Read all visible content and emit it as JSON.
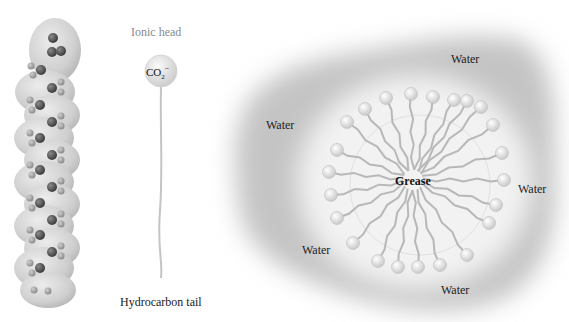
{
  "figure": {
    "molecule_model": {
      "description": "space-filling model of a soap (carboxylate) molecule"
    },
    "schematic": {
      "head_label": "Ionic head",
      "head_formula": {
        "base": "CO",
        "subscript": "2",
        "superscript": "−"
      },
      "tail_label": "Hydrocarbon tail"
    },
    "micelle": {
      "center_label": "Grease",
      "water_labels": [
        {
          "text": "Water",
          "x": 451,
          "y": 63
        },
        {
          "text": "Water",
          "x": 266,
          "y": 130
        },
        {
          "text": "Water",
          "x": 518,
          "y": 193
        },
        {
          "text": "Water",
          "x": 302,
          "y": 255
        },
        {
          "text": "Water",
          "x": 441,
          "y": 294
        }
      ],
      "center": {
        "x": 413,
        "y": 180
      },
      "head_count": 23,
      "heads": [
        [
          386,
          98
        ],
        [
          411,
          94
        ],
        [
          433,
          97
        ],
        [
          454,
          100
        ],
        [
          467,
          101
        ],
        [
          481,
          107
        ],
        [
          347,
          122
        ],
        [
          365,
          109
        ],
        [
          493,
          125
        ],
        [
          337,
          150
        ],
        [
          502,
          153
        ],
        [
          329,
          172
        ],
        [
          504,
          180
        ],
        [
          331,
          195
        ],
        [
          496,
          205
        ],
        [
          337,
          218
        ],
        [
          489,
          223
        ],
        [
          353,
          243
        ],
        [
          467,
          255
        ],
        [
          378,
          261
        ],
        [
          398,
          267
        ],
        [
          418,
          267
        ],
        [
          440,
          265
        ]
      ]
    },
    "colors": {
      "background": "#ffffff",
      "water_halo": "#c9c9c9",
      "micelle_core": "#f4f4f4",
      "tail": "#b8b8b8",
      "head_fill": "#e6e6e6",
      "carbon_atom": "#555555",
      "hydrogen_atom": "#9a9a9a",
      "molecule_shell": "#cfcfcf"
    }
  }
}
